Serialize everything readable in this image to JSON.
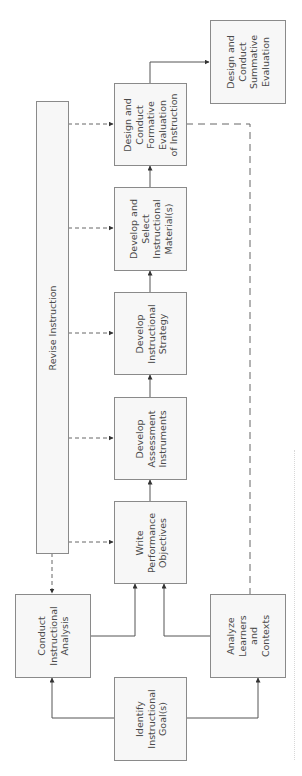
{
  "diagram": {
    "boxes": {
      "identify_goals": "Identify\nInstructional\nGoal(s)",
      "conduct_analysis": "Conduct\nInstructional\nAnalysis",
      "analyze_learners": "Analyze\nLearners\nand\nContexts",
      "write_objectives": "Write\nPerformance\nObjectives",
      "assessment": "Develop\nAssessment\nInstruments",
      "strategy": "Develop\nInstructional\nStrategy",
      "materials": "Develop and\nSelect\nInstructional\nMaterial(s)",
      "formative": "Design and\nConduct\nFormative\nEvaluation\nof Instruction",
      "summative": "Design and\nConduct\nSummative\nEvaluation",
      "revise": "Revise Instruction"
    },
    "colors": {
      "line": "#555555",
      "box_border": "#8a8a8a",
      "box_fill": "#f7f7f7",
      "text": "#4a4a4a"
    }
  }
}
